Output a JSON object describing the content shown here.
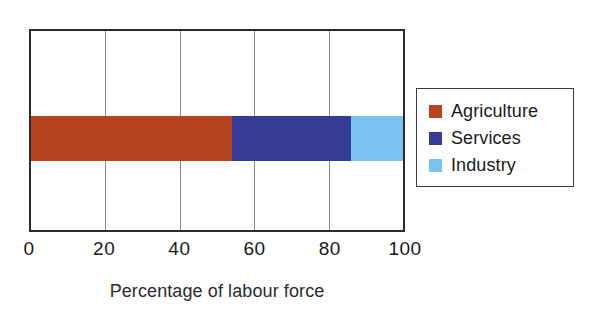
{
  "chart_data": {
    "type": "bar",
    "orientation": "horizontal",
    "stacked": true,
    "title": "",
    "xlabel": "Percentage of labour force",
    "ylabel": "",
    "xlim": [
      0,
      100
    ],
    "xticks": [
      0,
      20,
      40,
      60,
      80,
      100
    ],
    "xtick_labels": [
      "0",
      "20",
      "40",
      "60",
      "80",
      "100"
    ],
    "grid": "vertical gridlines at 20, 40, 60, 80",
    "legend_position": "right",
    "categories": [
      ""
    ],
    "series": [
      {
        "name": "Agriculture",
        "values": [
          54
        ],
        "color": "#b8431f"
      },
      {
        "name": "Services",
        "values": [
          32
        ],
        "color": "#363b95"
      },
      {
        "name": "Industry",
        "values": [
          14
        ],
        "color": "#79c4ee"
      }
    ],
    "segment_boundaries_percent": [
      0,
      54,
      86,
      100
    ],
    "total": 100
  },
  "title": {
    "text": "",
    "note": "title is cropped off the top of the screenshot"
  },
  "axis": {
    "x_label": "Percentage of labour force",
    "ticks": [
      {
        "value": 0,
        "label": "0"
      },
      {
        "value": 20,
        "label": "20"
      },
      {
        "value": 40,
        "label": "40"
      },
      {
        "value": 60,
        "label": "60"
      },
      {
        "value": 80,
        "label": "80"
      },
      {
        "value": 100,
        "label": "100"
      }
    ]
  },
  "legend": {
    "items": [
      {
        "label": "Agriculture",
        "color": "#b8431f"
      },
      {
        "label": "Services",
        "color": "#363b95"
      },
      {
        "label": "Industry",
        "color": "#79c4ee"
      }
    ]
  },
  "colors": {
    "agriculture": "#b8431f",
    "services": "#363b95",
    "industry": "#79c4ee",
    "frame": "#2b2b2b",
    "gridline": "#8b8b8b",
    "text": "#1a1a1a",
    "background": "#ffffff"
  }
}
